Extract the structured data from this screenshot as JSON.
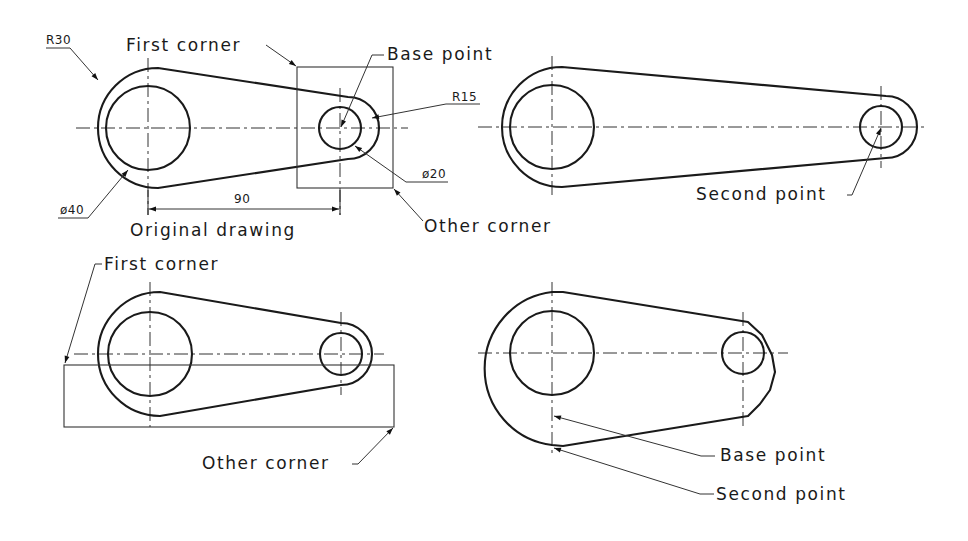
{
  "figure": {
    "stroke_color": "#1a1a1a",
    "background": "#ffffff"
  },
  "panels": {
    "top_left": {
      "caption": "Original drawing",
      "labels": {
        "first_corner": "First corner",
        "base_point": "Base point",
        "other_corner": "Other corner"
      },
      "dimensions": {
        "outer_radius": "R30",
        "inner_diameter": "ø40",
        "small_outer_radius": "R15",
        "small_inner_diameter": "ø20",
        "center_distance": "90"
      }
    },
    "top_right": {
      "labels": {
        "second_point": "Second point"
      }
    },
    "bottom_left": {
      "labels": {
        "first_corner": "First corner",
        "other_corner": "Other corner"
      }
    },
    "bottom_right": {
      "labels": {
        "base_point": "Base point",
        "second_point": "Second point"
      }
    }
  }
}
